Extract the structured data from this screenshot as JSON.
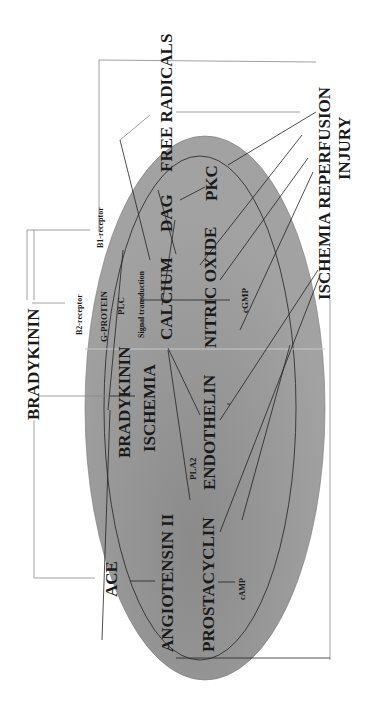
{
  "diagram": {
    "title_left": "BRADYKININ",
    "title_right_line1": "ISCHEMIA REPERFUSION",
    "title_right_line2": "INJURY",
    "free_radicals": "FREE RADICALS",
    "receptors": {
      "b1": "B1-receptor",
      "b2": "B2-receptor"
    },
    "inner_nodes": {
      "g_protein": "G-PROTEIN",
      "plc": "PLC",
      "signal_transduction": "Signal transduction",
      "calcium": "CALCIUM",
      "dag": "DAG",
      "pkc": "PKC",
      "nitric_oxide": "NITRIC OXIDE",
      "cgmp": "cGMP",
      "bradykinin": "BRADYKININ",
      "ischemia": "ISCHEMIA",
      "pla2": "PLA2",
      "endothelin": "ENDOTHELIN",
      "ace": "ACE",
      "angiotensin": "ANGIOTENSIN II",
      "prostacyclin": "PROSTACYCLIN",
      "camp": "cAMP"
    },
    "colors": {
      "ellipse_fill": "#9a9a9a",
      "line": "#222222",
      "text": "#1a1a1a"
    }
  }
}
